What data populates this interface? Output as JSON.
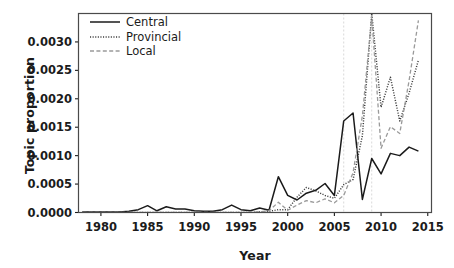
{
  "chart_data": {
    "type": "line",
    "title": "",
    "xlabel": "Year",
    "ylabel": "Topic proportion",
    "xlim": [
      1977.6,
      2015.4
    ],
    "ylim": [
      0.0,
      0.0035
    ],
    "xticks": [
      1980,
      1985,
      1990,
      1995,
      2000,
      2005,
      2010,
      2015
    ],
    "xtick_labels": [
      "1980",
      "1985",
      "1990",
      "1995",
      "2000",
      "2005",
      "2010",
      "2015"
    ],
    "yticks": [
      0.0,
      0.0005,
      0.001,
      0.0015,
      0.002,
      0.0025,
      0.003
    ],
    "ytick_labels": [
      "0.0000",
      "0.0005",
      "0.0010",
      "0.0015",
      "0.0020",
      "0.0025",
      "0.0030"
    ],
    "grid": false,
    "legend_position": "top-left",
    "reference_lines": [
      {
        "x": 2006,
        "style": "dashed",
        "color": "#d9d9d9"
      },
      {
        "x": 2009,
        "style": "dashed",
        "color": "#d9d9d9"
      }
    ],
    "x": [
      1978,
      1979,
      1980,
      1981,
      1982,
      1983,
      1984,
      1985,
      1986,
      1987,
      1988,
      1989,
      1990,
      1991,
      1992,
      1993,
      1994,
      1995,
      1996,
      1997,
      1998,
      1999,
      2000,
      2001,
      2002,
      2003,
      2004,
      2005,
      2006,
      2007,
      2008,
      2009,
      2010,
      2011,
      2012,
      2013,
      2014
    ],
    "series": [
      {
        "name": "Central",
        "style": "solid",
        "color": "#1b1b1b",
        "values": [
          1e-05,
          1e-05,
          1e-05,
          1e-05,
          1e-05,
          2e-05,
          5e-05,
          0.00012,
          3e-05,
          0.0001,
          6e-05,
          6e-05,
          3e-05,
          2e-05,
          2e-05,
          5e-05,
          0.00013,
          5e-05,
          3e-05,
          8e-05,
          4e-05,
          0.00063,
          0.0003,
          0.00022,
          0.00034,
          0.00039,
          0.00051,
          0.0003,
          0.00161,
          0.00175,
          0.00023,
          0.00095,
          0.00068,
          0.00104,
          0.001,
          0.00115,
          0.00108
        ]
      },
      {
        "name": "Provincial",
        "style": "dotted",
        "color": "#3c3c3c",
        "values": [
          0.0,
          0.0,
          0.0,
          0.0,
          0.0,
          0.0,
          0.0,
          0.0,
          0.0,
          0.0,
          0.0,
          0.0,
          0.0,
          0.0,
          0.0,
          0.0,
          0.0,
          0.0,
          0.0,
          1e-05,
          2e-05,
          5e-05,
          5e-05,
          0.00027,
          0.00044,
          0.00038,
          0.0003,
          0.00025,
          0.00049,
          0.00058,
          0.00135,
          0.0035,
          0.00185,
          0.00238,
          0.00161,
          0.0021,
          0.00268
        ]
      },
      {
        "name": "Local",
        "style": "dashed",
        "color": "#9a9a9a",
        "values": [
          0.0,
          0.0,
          0.0,
          0.0,
          0.0,
          0.0,
          0.0,
          0.0,
          0.0,
          0.0,
          0.0,
          0.0,
          0.0,
          0.0,
          0.0,
          0.0,
          0.0,
          0.0,
          0.0,
          1e-05,
          3e-05,
          0.00018,
          4e-05,
          0.00013,
          0.00021,
          0.00017,
          0.00024,
          0.00017,
          0.0003,
          0.0007,
          0.0017,
          0.00345,
          0.00113,
          0.00151,
          0.00139,
          0.00232,
          0.00338
        ]
      }
    ]
  },
  "legend": {
    "entries": [
      {
        "label": "Central"
      },
      {
        "label": "Provincial"
      },
      {
        "label": "Local"
      }
    ]
  }
}
